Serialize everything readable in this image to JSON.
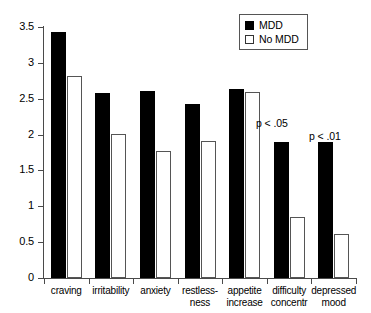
{
  "chart_data": {
    "type": "bar",
    "title": "",
    "subtitle": "",
    "xlabel": "",
    "ylabel": "",
    "ylim": [
      0,
      3.5
    ],
    "grid": false,
    "legend_position": "top-right",
    "categories": [
      "craving",
      "irritability",
      "anxiety",
      "restless-ness",
      "appetite increase",
      "difficulty concentr",
      "depressed mood"
    ],
    "category_lines": [
      [
        "craving"
      ],
      [
        "irritability"
      ],
      [
        "anxiety"
      ],
      [
        "restless-",
        "ness"
      ],
      [
        "appetite",
        "increase"
      ],
      [
        "difficulty",
        "concentr"
      ],
      [
        "depressed",
        "mood"
      ]
    ],
    "ytick_labels": [
      "0",
      "0.5",
      "1",
      "1.5",
      "2",
      "2.5",
      "3",
      "3.5"
    ],
    "ytick_values": [
      0,
      0.5,
      1,
      1.5,
      2,
      2.5,
      3,
      3.5
    ],
    "series": [
      {
        "name": "MDD",
        "color": "#000000",
        "style": "filled",
        "values": [
          3.43,
          2.58,
          2.61,
          2.43,
          2.63,
          1.89,
          1.9
        ]
      },
      {
        "name": "No MDD",
        "color": "#ffffff",
        "style": "open",
        "values": [
          2.82,
          2.01,
          1.77,
          1.91,
          2.6,
          0.85,
          0.61
        ]
      }
    ],
    "annotations": [
      {
        "text": "p < .05",
        "category": "difficulty concentr"
      },
      {
        "text": "p < .01",
        "category": "depressed mood"
      }
    ]
  },
  "legend": {
    "items": [
      {
        "label": "MDD",
        "style": "filled"
      },
      {
        "label": "No MDD",
        "style": "open"
      }
    ]
  }
}
